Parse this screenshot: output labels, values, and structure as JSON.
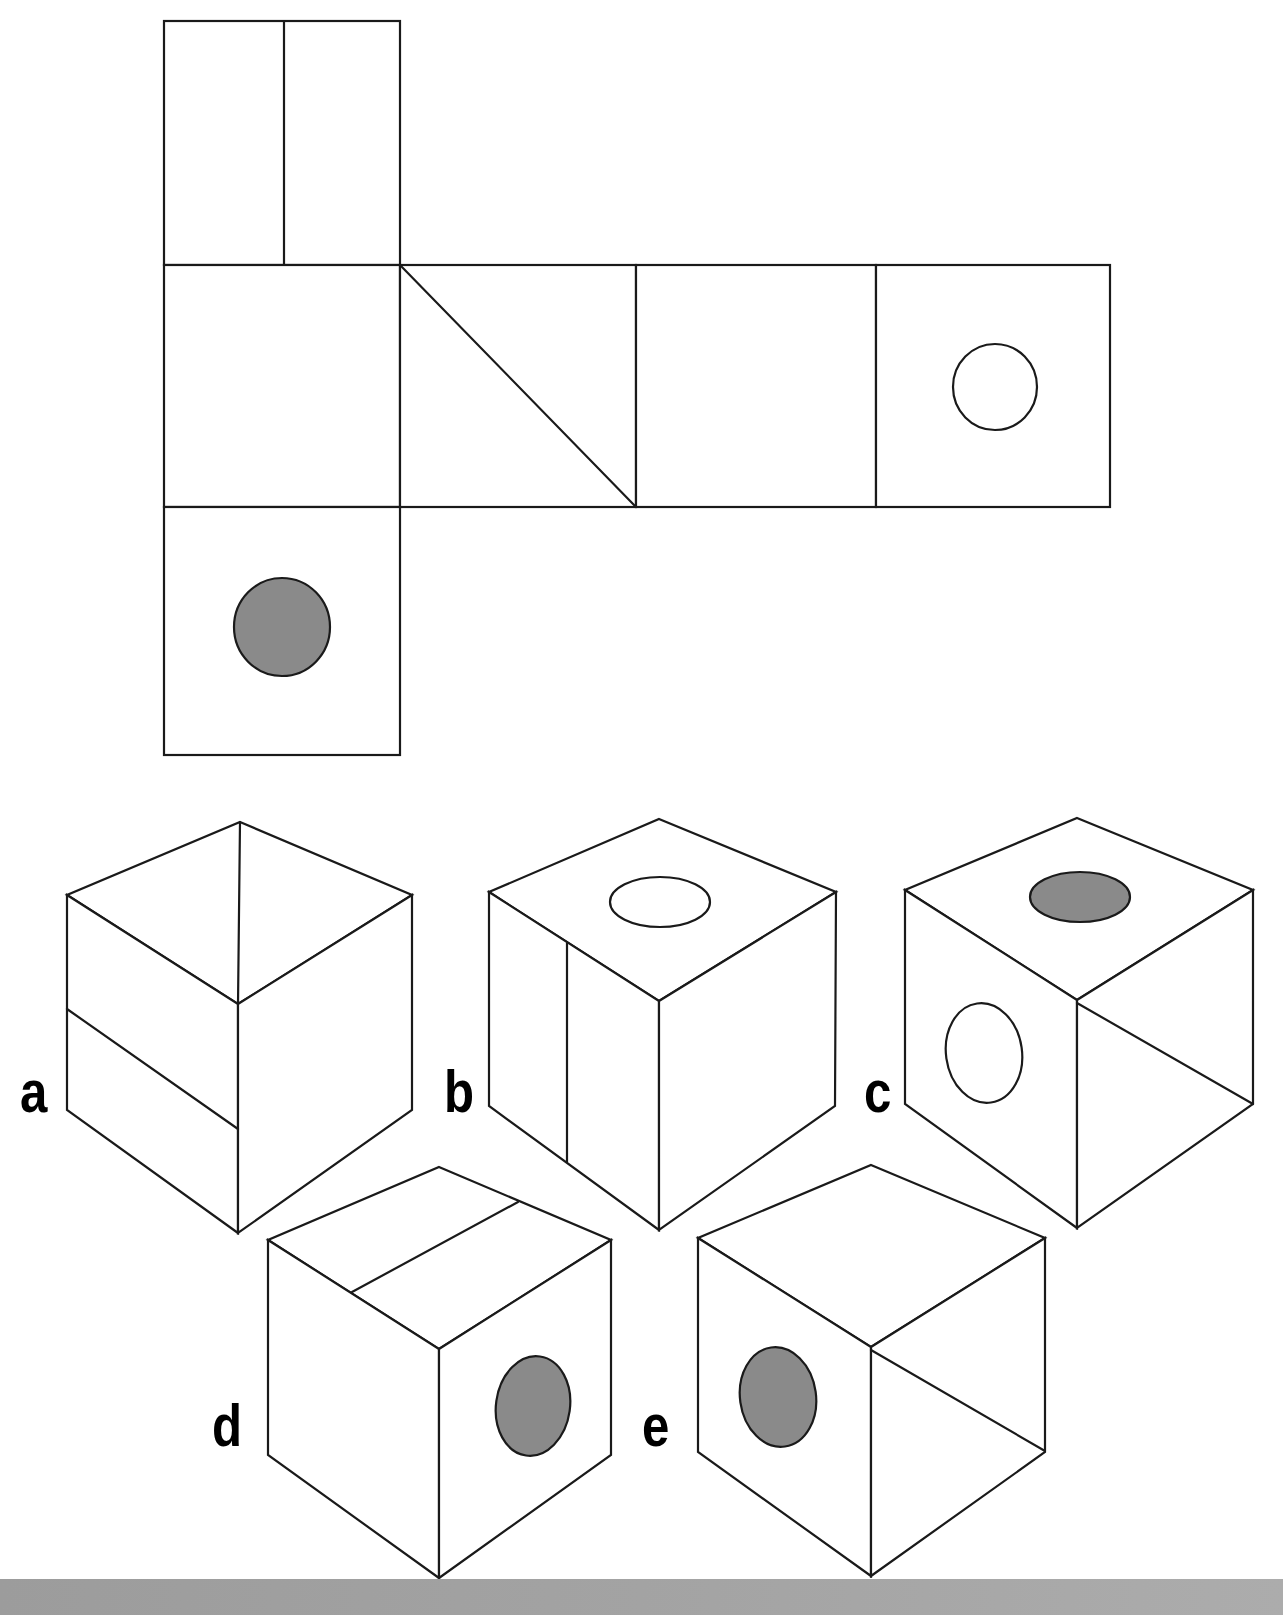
{
  "diagram": {
    "type": "cube-net-folding-puzzle",
    "colors": {
      "line": "#1a1a1a",
      "face_fill": "#ffffff",
      "filled_dot": "#8a8a8a",
      "footer_band": "#9c9c9c"
    },
    "net": {
      "panels": [
        {
          "id": "top-panel",
          "x": 164,
          "y": 21,
          "w": 236,
          "h": 244,
          "marking": "vertical-split",
          "split_x": 284
        },
        {
          "id": "middle-left",
          "x": 164,
          "y": 265,
          "w": 236,
          "h": 242,
          "marking": "blank"
        },
        {
          "id": "middle-diagonal",
          "x": 400,
          "y": 265,
          "w": 236,
          "h": 242,
          "marking": "diagonal"
        },
        {
          "id": "middle-blank",
          "x": 636,
          "y": 265,
          "w": 240,
          "h": 242,
          "marking": "blank"
        },
        {
          "id": "middle-hollow-dot",
          "x": 876,
          "y": 265,
          "w": 234,
          "h": 242,
          "marking": "hollow-circle",
          "circle": {
            "cx": 995,
            "cy": 387,
            "rx": 42,
            "ry": 43
          }
        },
        {
          "id": "bottom-panel",
          "x": 164,
          "y": 507,
          "w": 236,
          "h": 248,
          "marking": "filled-circle",
          "circle": {
            "cx": 282,
            "cy": 627,
            "rx": 48,
            "ry": 49
          }
        }
      ]
    },
    "options": [
      {
        "label": "a",
        "label_pos": {
          "x": 20,
          "y": 1112
        },
        "v": {
          "top": [
            240,
            822
          ],
          "lt": [
            67,
            895
          ],
          "rt": [
            412,
            895
          ],
          "c": [
            238,
            1004
          ],
          "lb": [
            67,
            1110
          ],
          "rb": [
            412,
            1110
          ],
          "b": [
            238,
            1233
          ]
        },
        "lines": [
          [
            [
              240,
              822
            ],
            [
              238,
              1004
            ]
          ],
          [
            [
              67,
              1009
            ],
            [
              238,
              1129
            ]
          ]
        ],
        "dots": []
      },
      {
        "label": "b",
        "label_pos": {
          "x": 444,
          "y": 1112
        },
        "v": {
          "top": [
            659,
            819
          ],
          "lt": [
            489,
            892
          ],
          "rt": [
            836,
            892
          ],
          "c": [
            659,
            1001
          ],
          "lb": [
            489,
            1106
          ],
          "rb": [
            835,
            1106
          ],
          "b": [
            659,
            1230
          ]
        },
        "lines": [
          [
            [
              567,
              943
            ],
            [
              567,
              1162
            ]
          ]
        ],
        "dots": [
          {
            "cx": 660,
            "cy": 902,
            "rx": 50,
            "ry": 25,
            "filled": false
          }
        ]
      },
      {
        "label": "c",
        "label_pos": {
          "x": 864,
          "y": 1112
        },
        "v": {
          "top": [
            1077,
            818
          ],
          "lt": [
            905,
            890
          ],
          "rt": [
            1253,
            890
          ],
          "c": [
            1077,
            1000
          ],
          "lb": [
            905,
            1104
          ],
          "rb": [
            1253,
            1104
          ],
          "b": [
            1077,
            1228
          ]
        },
        "lines": [
          [
            [
              1077,
              1003
            ],
            [
              1253,
              1104
            ]
          ]
        ],
        "dots": [
          {
            "cx": 1080,
            "cy": 897,
            "rx": 50,
            "ry": 25,
            "filled": true
          },
          {
            "cx": 984,
            "cy": 1053,
            "rx": 38,
            "ry": 50,
            "filled": false,
            "rotate": -8
          }
        ]
      },
      {
        "label": "d",
        "label_pos": {
          "x": 212,
          "y": 1446
        },
        "v": {
          "top": [
            439,
            1167
          ],
          "lt": [
            268,
            1240
          ],
          "rt": [
            611,
            1240
          ],
          "c": [
            439,
            1349
          ],
          "lb": [
            268,
            1455
          ],
          "rb": [
            611,
            1455
          ],
          "b": [
            439,
            1578
          ]
        },
        "lines": [
          [
            [
              352,
              1292
            ],
            [
              518,
              1202
            ]
          ]
        ],
        "dots": [
          {
            "cx": 533,
            "cy": 1406,
            "rx": 37,
            "ry": 50,
            "filled": true,
            "rotate": 8
          }
        ]
      },
      {
        "label": "e",
        "label_pos": {
          "x": 642,
          "y": 1446
        },
        "v": {
          "top": [
            871,
            1165
          ],
          "lt": [
            698,
            1238
          ],
          "rt": [
            1045,
            1238
          ],
          "c": [
            871,
            1347
          ],
          "lb": [
            698,
            1452
          ],
          "rb": [
            1045,
            1452
          ],
          "b": [
            871,
            1576
          ]
        },
        "lines": [
          [
            [
              871,
              1350
            ],
            [
              1045,
              1451
            ]
          ]
        ],
        "dots": [
          {
            "cx": 778,
            "cy": 1397,
            "rx": 38,
            "ry": 50,
            "filled": true,
            "rotate": -8
          }
        ]
      }
    ]
  }
}
